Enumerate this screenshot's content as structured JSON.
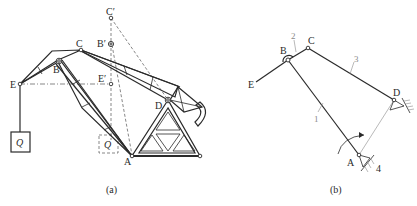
{
  "figure_a": {
    "caption": "(a)",
    "points": {
      "C_prime": "C′",
      "B_prime": "B′",
      "C": "C",
      "B": "B",
      "E": "E",
      "E_prime": "E′",
      "D": "D",
      "A": "A"
    },
    "load_label": "Q",
    "load_ghost_label": "Q"
  },
  "figure_b": {
    "caption": "(b)",
    "points": {
      "B": "B",
      "C": "C",
      "E": "E",
      "D": "D",
      "A": "A"
    },
    "link_numbers": {
      "link1": "1",
      "link2": "2",
      "link3": "3",
      "frame": "4"
    }
  },
  "colors": {
    "line": "#2a2a2a",
    "dashed": "#555555",
    "annotation": "#8a8a8a",
    "background": "#ffffff"
  }
}
